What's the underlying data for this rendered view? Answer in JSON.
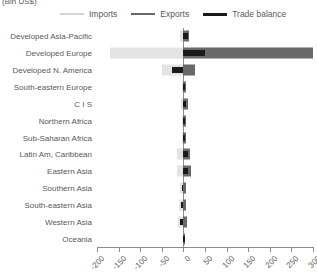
{
  "chart_data": {
    "type": "bar",
    "orientation": "horizontal",
    "title": "(Bln US$)",
    "xlabel": "",
    "ylabel": "",
    "xlim": [
      -200,
      300
    ],
    "xticks": [
      -200,
      -150,
      -100,
      -50,
      0,
      50,
      100,
      150,
      200,
      250,
      300
    ],
    "grid": false,
    "legend_position": "top",
    "categories": [
      "Developed Asia-Pacific",
      "Developed Europe",
      "Developed N. America",
      "South-eastern Europe",
      "C I S",
      "Northern Africa",
      "Sub-Saharan Africa",
      "Latin Am, Caribbean",
      "Eastern Asia",
      "Southern Asia",
      "South-eastern Asia",
      "Western Asia",
      "Oceania"
    ],
    "series": [
      {
        "name": "Imports",
        "color": "#e3e3e3",
        "values": [
          -8,
          -170,
          -50,
          -4,
          -5,
          -3,
          -4,
          -14,
          -14,
          -8,
          -10,
          -13,
          -1
        ]
      },
      {
        "name": "Exports",
        "color": "#696969",
        "values": [
          13,
          300,
          28,
          5,
          10,
          5,
          7,
          16,
          17,
          7,
          6,
          9,
          1
        ]
      },
      {
        "name": "Trade balance",
        "color": "#1a1a1a",
        "values": [
          11,
          50,
          -26,
          3,
          7,
          3,
          4,
          10,
          11,
          -3,
          -5,
          -7,
          1
        ]
      }
    ]
  },
  "legend": {
    "items": [
      {
        "label": "Imports",
        "color": "#d4d4d4"
      },
      {
        "label": "Exports",
        "color": "#696969"
      },
      {
        "label": "Trade balance",
        "color": "#1a1a1a"
      }
    ]
  }
}
